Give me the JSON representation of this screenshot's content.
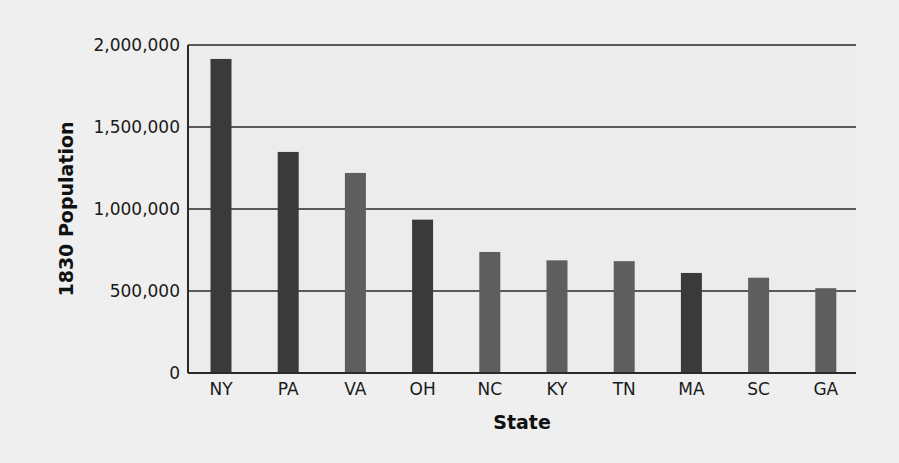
{
  "chart_data": {
    "type": "bar",
    "title": "",
    "xlabel": "State",
    "ylabel": "1830 Population",
    "categories": [
      "NY",
      "PA",
      "VA",
      "OH",
      "NC",
      "KY",
      "TN",
      "MA",
      "SC",
      "GA"
    ],
    "values": [
      1915000,
      1348000,
      1220000,
      935000,
      738000,
      687000,
      682000,
      610000,
      581000,
      517000
    ],
    "ylim": [
      0,
      2000000
    ],
    "yticks": [
      0,
      500000,
      1000000,
      1500000,
      2000000
    ],
    "ytick_labels": [
      "0",
      "500,000",
      "1,000,000",
      "1,500,000",
      "2,000,000"
    ],
    "grid": true,
    "legend": null,
    "bar_colors": [
      "#3a3a3a",
      "#3a3a3a",
      "#5e5e5e",
      "#3a3a3a",
      "#5e5e5e",
      "#5e5e5e",
      "#5e5e5e",
      "#3a3a3a",
      "#5e5e5e",
      "#5e5e5e"
    ]
  }
}
